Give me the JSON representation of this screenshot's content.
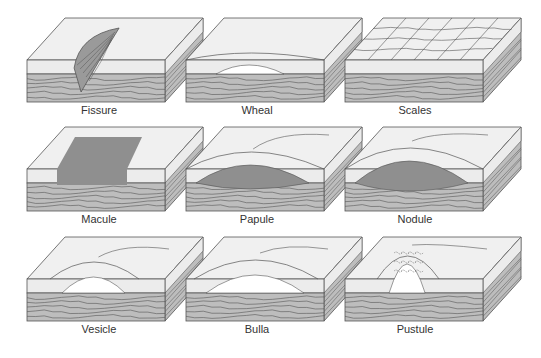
{
  "colors": {
    "epidermis": "#ececec",
    "top_face": "#f0f0f0",
    "dermis": "#bdbdbd",
    "lesion_dark": "#8f8f8f",
    "line": "#555555",
    "fluid": "#ffffff"
  },
  "lesions": [
    {
      "name": "Fissure",
      "row": 0,
      "col": 0,
      "kind": "fissure"
    },
    {
      "name": "Wheal",
      "row": 0,
      "col": 1,
      "kind": "wheal"
    },
    {
      "name": "Scales",
      "row": 0,
      "col": 2,
      "kind": "scales"
    },
    {
      "name": "Macule",
      "row": 1,
      "col": 0,
      "kind": "macule"
    },
    {
      "name": "Papule",
      "row": 1,
      "col": 1,
      "kind": "papule"
    },
    {
      "name": "Nodule",
      "row": 1,
      "col": 2,
      "kind": "nodule"
    },
    {
      "name": "Vesicle",
      "row": 2,
      "col": 0,
      "kind": "vesicle"
    },
    {
      "name": "Bulla",
      "row": 2,
      "col": 1,
      "kind": "bulla"
    },
    {
      "name": "Pustule",
      "row": 2,
      "col": 2,
      "kind": "pustule"
    }
  ]
}
